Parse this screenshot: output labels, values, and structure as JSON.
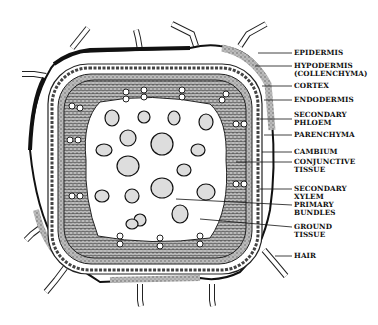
{
  "figure": {
    "labels": [
      {
        "id": "epidermis",
        "text": "EPIDERMIS",
        "y": 49,
        "tx": 258,
        "ty": 53
      },
      {
        "id": "hypodermis",
        "text": "HYPODERMIS\n(COLLENCHYMA)",
        "y": 62,
        "tx": 255,
        "ty": 66
      },
      {
        "id": "cortex",
        "text": "CORTEX",
        "y": 82,
        "tx": 262,
        "ty": 86
      },
      {
        "id": "endodermis",
        "text": "ENDODERMIS",
        "y": 96,
        "tx": 264,
        "ty": 100
      },
      {
        "id": "secondary-phloem",
        "text": "SECONDARY\nPHLOEM",
        "y": 110,
        "tx": 260,
        "ty": 119
      },
      {
        "id": "parenchyma",
        "text": "PARENCHYMA",
        "y": 131,
        "tx": 264,
        "ty": 135
      },
      {
        "id": "cambium",
        "text": "CAMBIUM",
        "y": 148,
        "tx": 262,
        "ty": 152
      },
      {
        "id": "conjunctive-tissue",
        "text": "CONJUNCTIVE\nTISSUE",
        "y": 158,
        "tx": 236,
        "ty": 162
      },
      {
        "id": "secondary-xylem",
        "text": "SECONDARY\nXYLEM",
        "y": 184,
        "tx": 258,
        "ty": 189
      },
      {
        "id": "primary-bundles",
        "text": "PRIMARY\nBUNDLES",
        "y": 201,
        "tx": 176,
        "ty": 199
      },
      {
        "id": "ground-tissue",
        "text": "GROUND\nTISSUE",
        "y": 223,
        "tx": 200,
        "ty": 219
      },
      {
        "id": "hair",
        "text": "HAIR",
        "y": 257,
        "tx": 275,
        "ty": 256
      }
    ]
  }
}
